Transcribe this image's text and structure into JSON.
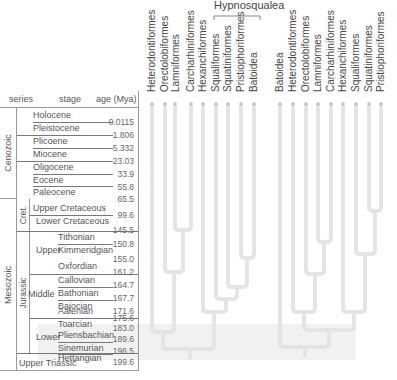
{
  "timescale": {
    "headers": {
      "series": "series",
      "stage": "stage",
      "age": "age (Mya)"
    },
    "eras": [
      {
        "name": "Cenozoic"
      },
      {
        "name": "Mesozoic"
      }
    ],
    "subdivisions": [
      {
        "name": "Cret."
      },
      {
        "name": "Jurassic"
      }
    ],
    "jurassic_series": [
      {
        "name": "Upper"
      },
      {
        "name": "Middle"
      },
      {
        "name": "Lower"
      }
    ],
    "rows": [
      {
        "stage": "Holocene",
        "age": "0.0115"
      },
      {
        "stage": "Pleistocene",
        "age": "1.806"
      },
      {
        "stage": "Plicoene",
        "age": "5.332"
      },
      {
        "stage": "Miocene",
        "age": "23.03"
      },
      {
        "stage": "Oligocene",
        "age": "33.9"
      },
      {
        "stage": "Eocene",
        "age": "55.8"
      },
      {
        "stage": "Paleocene",
        "age": "65.5"
      },
      {
        "stage": "Upper Cretaceous",
        "age": "99.6"
      },
      {
        "stage": "Lower Cretaceous",
        "age": "145.5"
      },
      {
        "stage": "Tithonian",
        "age": "150.8"
      },
      {
        "stage": "Kimmeridgian",
        "age": "155.0"
      },
      {
        "stage": "Oxfordian",
        "age": "161.2"
      },
      {
        "stage": "Callovian",
        "age": "164.7"
      },
      {
        "stage": "Bathonian",
        "age": "167.7"
      },
      {
        "stage": "Bajocian",
        "age": "171.6"
      },
      {
        "stage": "Aalenian",
        "age": "175.6"
      },
      {
        "stage": "Toarcian",
        "age": "183.0"
      },
      {
        "stage": "Pliensbachian",
        "age": "189.6"
      },
      {
        "stage": "Sinemurian",
        "age": "196.5"
      },
      {
        "stage": "Hettangian",
        "age": "199.6"
      }
    ],
    "bottom": "Upper Triassic"
  },
  "clade_label": "Hypnosqualea",
  "tree_left": {
    "leaves": [
      "Heterodontiformes",
      "Orectolobiformes",
      "Lamniformes",
      "Carcharhiniformes",
      "Hexanchiformes",
      "Squaliformes",
      "Squatiniformes",
      "Pristiophoriformes",
      "Batoidea"
    ]
  },
  "tree_right": {
    "leaves": [
      "Batoidea",
      "Heterodontiformes",
      "Orectolobiformes",
      "Lamniformes",
      "Carcharhiniformes",
      "Hexanchiformes",
      "Squaliformes",
      "Squatiniformes",
      "Pristiophoriformes"
    ]
  },
  "colors": {
    "branch": "#e4e4e4",
    "shade": "#f1f1f1",
    "dot": "#bdbdbd"
  }
}
